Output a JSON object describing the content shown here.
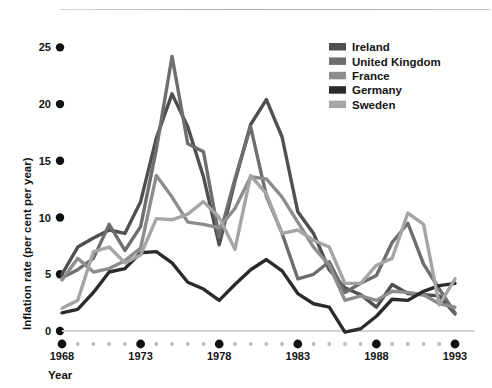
{
  "chart_data": {
    "type": "line",
    "title": "",
    "xlabel": "Year",
    "ylabel": "Inflation rate (per cent per year)",
    "xlim": [
      1968,
      1993
    ],
    "ylim": [
      0,
      26
    ],
    "grid": false,
    "legend_position": "top-right",
    "x_ticks_major": [
      1968,
      1973,
      1978,
      1983,
      1988,
      1993
    ],
    "x_ticks_minor": [
      1969,
      1970,
      1971,
      1972,
      1974,
      1975,
      1976,
      1977,
      1979,
      1980,
      1981,
      1982,
      1984,
      1985,
      1986,
      1987,
      1989,
      1990,
      1991,
      1992
    ],
    "y_ticks": [
      0,
      5,
      10,
      15,
      20,
      25
    ],
    "x": [
      1968,
      1969,
      1970,
      1971,
      1972,
      1973,
      1974,
      1975,
      1976,
      1977,
      1978,
      1979,
      1980,
      1981,
      1982,
      1983,
      1984,
      1985,
      1986,
      1987,
      1988,
      1989,
      1990,
      1991,
      1992,
      1993
    ],
    "series": [
      {
        "name": "Ireland",
        "color": "#4f4f4f",
        "values": [
          5.0,
          7.4,
          8.2,
          8.9,
          8.6,
          11.4,
          17.0,
          20.9,
          18.0,
          13.6,
          7.6,
          13.2,
          18.2,
          20.4,
          17.1,
          10.5,
          8.6,
          5.4,
          3.8,
          3.2,
          2.1,
          4.1,
          3.3,
          3.2,
          3.1,
          1.5
        ]
      },
      {
        "name": "United Kingdom",
        "color": "#6e6e6e",
        "values": [
          4.7,
          5.4,
          6.4,
          9.4,
          7.1,
          9.2,
          16.0,
          24.2,
          16.5,
          15.8,
          8.3,
          13.4,
          18.0,
          11.9,
          8.6,
          4.6,
          5.0,
          6.1,
          3.4,
          4.2,
          4.9,
          7.8,
          9.5,
          5.9,
          3.7,
          1.6
        ]
      },
      {
        "name": "France",
        "color": "#8d8d8d",
        "values": [
          4.5,
          6.4,
          5.2,
          5.5,
          6.2,
          7.3,
          13.7,
          11.8,
          9.6,
          9.4,
          9.1,
          10.8,
          13.6,
          13.4,
          11.8,
          9.6,
          7.4,
          5.8,
          2.7,
          3.1,
          2.7,
          3.5,
          3.4,
          3.2,
          2.4,
          2.1
        ]
      },
      {
        "name": "Germany",
        "color": "#2b2b2b",
        "values": [
          1.6,
          1.9,
          3.4,
          5.2,
          5.5,
          6.9,
          7.0,
          6.0,
          4.3,
          3.7,
          2.7,
          4.1,
          5.4,
          6.3,
          5.3,
          3.3,
          2.4,
          2.1,
          -0.1,
          0.2,
          1.3,
          2.8,
          2.7,
          3.5,
          4.0,
          4.2
        ]
      },
      {
        "name": "Sweden",
        "color": "#a5a5a5",
        "values": [
          2.0,
          2.7,
          7.0,
          7.4,
          6.0,
          6.7,
          9.9,
          9.8,
          10.3,
          11.4,
          10.0,
          7.2,
          13.7,
          12.1,
          8.6,
          8.9,
          8.0,
          7.4,
          4.2,
          4.2,
          5.8,
          6.4,
          10.4,
          9.4,
          2.3,
          4.6
        ]
      }
    ]
  },
  "legend": {
    "items": [
      {
        "label": "Ireland"
      },
      {
        "label": "United Kingdom"
      },
      {
        "label": "France"
      },
      {
        "label": "Germany"
      },
      {
        "label": "Sweden"
      }
    ]
  },
  "axes": {
    "y_label": "Inflation rate (per cent per year)",
    "x_label": "Year",
    "y_tick_labels": [
      "0",
      "5",
      "10",
      "15",
      "20",
      "25"
    ],
    "x_tick_labels": [
      "1968",
      "1973",
      "1978",
      "1983",
      "1988",
      "1993"
    ]
  }
}
